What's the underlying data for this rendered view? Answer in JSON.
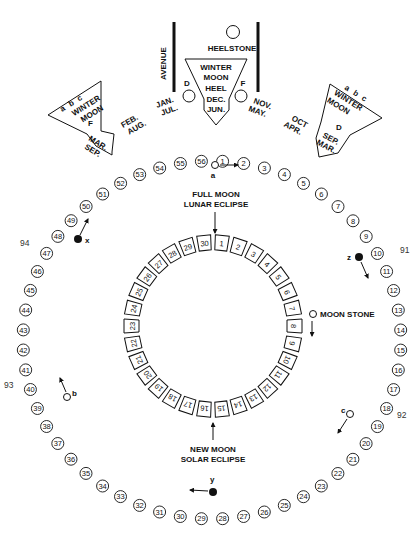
{
  "diagram": {
    "outer_ring": {
      "count": 56,
      "center": [
        212,
        340
      ],
      "rx": 189,
      "ry": 179,
      "start_label": 56
    },
    "inner_ring": {
      "count": 30,
      "center": [
        213,
        326
      ],
      "rx": 81,
      "ry": 83
    },
    "labels": {
      "avenue": "AVENUE",
      "heelstone": "HEELSTONE",
      "full_moon": "FULL MOON",
      "lunar_eclipse": "LUNAR ECLIPSE",
      "new_moon": "NEW MOON",
      "solar_eclipse": "SOLAR ECLIPSE",
      "moon_stone": "MOON STONE"
    },
    "center_marker": {
      "lines": [
        "WINTER",
        "MOON",
        "HEEL",
        "DEC.",
        "JUN."
      ],
      "d": "D",
      "f": "F"
    },
    "left_marker": {
      "abc": [
        "a",
        "b",
        "c"
      ],
      "lines": [
        "WINTER",
        "MOON",
        "F",
        "MAR.",
        "SEP."
      ]
    },
    "right_marker": {
      "abc": [
        "a",
        "b",
        "c"
      ],
      "lines": [
        "WINTER",
        "MOON",
        "D",
        "SEP.",
        "MAR."
      ]
    },
    "months": [
      {
        "top": "FEB.",
        "bottom": "AUG."
      },
      {
        "top": "JAN.",
        "bottom": "JUL."
      },
      {
        "top": "NOV.",
        "bottom": "MAY."
      },
      {
        "top": "OCT",
        "bottom": "APR."
      }
    ],
    "stations": {
      "a": "a",
      "b": "b",
      "c": "c",
      "x": "x",
      "y": "y",
      "z": "z"
    },
    "side_numbers": {
      "n91": "91",
      "n92": "92",
      "n93": "93",
      "n94": "94"
    }
  }
}
